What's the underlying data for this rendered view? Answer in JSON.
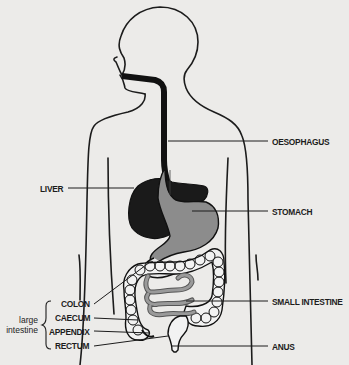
{
  "diagram": {
    "colors": {
      "background": "#ecebe9",
      "outline": "#1c1c1c",
      "liver": "#1a1a1a",
      "stomach": "#8c8c8c",
      "small_intestine": "#8a8a8a",
      "colon": "#f2f2f2"
    },
    "labels_right": [
      {
        "id": "oesophagus",
        "text": "OESOPHAGUS"
      },
      {
        "id": "stomach",
        "text": "STOMACH"
      },
      {
        "id": "small_intestine",
        "text": "SMALL INTESTINE"
      },
      {
        "id": "anus",
        "text": "ANUS"
      }
    ],
    "labels_left": [
      {
        "id": "liver",
        "text": "LIVER"
      },
      {
        "id": "colon",
        "text": "COLON"
      },
      {
        "id": "caecum",
        "text": "CAECUM"
      },
      {
        "id": "appendix",
        "text": "APPENDIX"
      },
      {
        "id": "rectum",
        "text": "RECTUM"
      }
    ],
    "group": {
      "line1": "large",
      "line2": "intestine"
    }
  }
}
